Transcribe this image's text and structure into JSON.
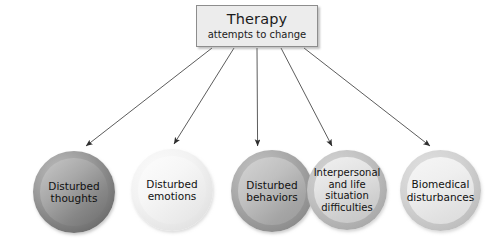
{
  "diagram": {
    "type": "radial-flow",
    "background_color": "#ffffff",
    "root": {
      "title": "Therapy",
      "subtitle": "attempts to change",
      "box_fill": "#ececec",
      "box_border": "#8d8d8d"
    },
    "relation_label": "attempts to change",
    "nodes": [
      {
        "id": "disturbed-thoughts",
        "label": "Disturbed\nthoughts",
        "line1": "Disturbed",
        "line2": "thoughts",
        "fill": "#8a8a8a",
        "ring": "#6f6f6f"
      },
      {
        "id": "disturbed-emotions",
        "label": "Disturbed\nemotions",
        "line1": "Disturbed",
        "line2": "emotions",
        "fill": "#f2f2f2",
        "ring": "#e2e2e2"
      },
      {
        "id": "disturbed-behaviors",
        "label": "Disturbed\nbehaviors",
        "line1": "Disturbed",
        "line2": "behaviors",
        "fill": "#b5b5b5",
        "ring": "#8b8b8b"
      },
      {
        "id": "interpersonal-life-situation-difficulties",
        "label": "Interpersonal\nand life\nsituation\ndifficulties",
        "line1": "Interpersonal",
        "line2": "and life",
        "line3": "situation",
        "line4": "difficulties",
        "fill": "#dedede",
        "ring": "#b3b3b3"
      },
      {
        "id": "biomedical-disturbances",
        "label": "Biomedical\ndisturbances",
        "line1": "Biomedical",
        "line2": "disturbances",
        "fill": "#ececec",
        "ring": "#c4c4c4"
      }
    ],
    "arrows": {
      "count": 5,
      "color": "#3a3a3a",
      "style": "solid-thin-filled-head"
    }
  }
}
